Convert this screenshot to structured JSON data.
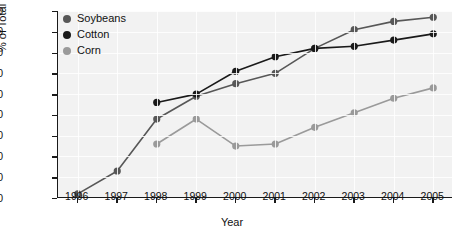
{
  "chart_data": {
    "type": "line",
    "title": "",
    "xlabel": "Year",
    "ylabel": "% of Total U.S. Acreage",
    "xlim": [
      1995.5,
      2005.5
    ],
    "ylim": [
      0,
      90
    ],
    "ytick_step": 10,
    "grid": true,
    "legend_position": "top-left",
    "categories": [
      "1996",
      "1997",
      "1998",
      "1999",
      "2000",
      "2001",
      "2002",
      "2003",
      "2004",
      "2005"
    ],
    "x": [
      1996,
      1997,
      1998,
      1999,
      2000,
      2001,
      2002,
      2003,
      2004,
      2005
    ],
    "series": [
      {
        "name": "Soybeans",
        "color": "#575757",
        "x": [
          1996,
          1997,
          1998,
          1999,
          2000,
          2001,
          2002,
          2003,
          2004,
          2005
        ],
        "values": [
          2,
          13,
          38,
          49,
          55,
          60,
          72,
          81,
          85,
          87
        ]
      },
      {
        "name": "Cotton",
        "color": "#1a1a1a",
        "x": [
          1998,
          1999,
          2000,
          2001,
          2002,
          2003,
          2004,
          2005
        ],
        "values": [
          46,
          50,
          61,
          68,
          72,
          73,
          76,
          79
        ]
      },
      {
        "name": "Corn",
        "color": "#9a9a9a",
        "x": [
          1998,
          1999,
          2000,
          2001,
          2002,
          2003,
          2004,
          2005
        ],
        "values": [
          26,
          38,
          25,
          26,
          34,
          41,
          48,
          53
        ]
      }
    ]
  },
  "axes": {
    "yticks": [
      "0",
      "10",
      "20",
      "30",
      "40",
      "50",
      "60",
      "70",
      "80",
      "90"
    ],
    "xticks": [
      "1996",
      "1997",
      "1998",
      "1999",
      "2000",
      "2001",
      "2002",
      "2003",
      "2004",
      "2005"
    ],
    "ylabel": "% of Total U.S. Acreage",
    "xlabel": "Year"
  },
  "legend": {
    "items": [
      {
        "label": "Soybeans",
        "color": "#575757"
      },
      {
        "label": "Cotton",
        "color": "#1a1a1a"
      },
      {
        "label": "Corn",
        "color": "#9a9a9a"
      }
    ]
  }
}
